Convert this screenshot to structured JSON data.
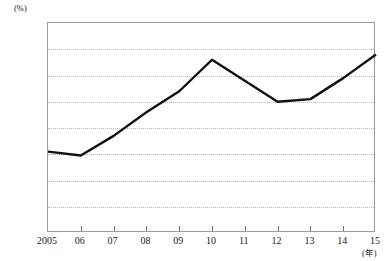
{
  "chart_data": {
    "type": "line",
    "title": "",
    "xlabel": "(年)",
    "ylabel": "(%)",
    "categories": [
      "2005",
      "06",
      "07",
      "08",
      "09",
      "10",
      "11",
      "12",
      "13",
      "14",
      "15"
    ],
    "x": [
      2005,
      2006,
      2007,
      2008,
      2009,
      2010,
      2011,
      2012,
      2013,
      2014,
      2015
    ],
    "values": [
      60.1,
      59.95,
      60.7,
      61.6,
      62.4,
      63.6,
      62.8,
      62.0,
      62.1,
      62.9,
      63.8
    ],
    "series": [
      {
        "name": "",
        "values": [
          60.1,
          59.95,
          60.7,
          61.6,
          62.4,
          63.6,
          62.8,
          62.0,
          62.1,
          62.9,
          63.8
        ]
      }
    ],
    "ylim": [
      57.0,
      65.0
    ],
    "ytick_step": 1.0,
    "ytick_labels": [
      "65.0",
      "64.0",
      "63.0",
      "62.0",
      "61.0",
      "60.0",
      "59.0",
      "58.0",
      "57.0"
    ],
    "ytick_values": [
      65.0,
      64.0,
      63.0,
      62.0,
      61.0,
      60.0,
      59.0,
      58.0,
      57.0
    ],
    "grid": true,
    "grid_axis": "y",
    "legend": false,
    "legend_position": "none",
    "line_color": "#111111",
    "line_width": 2.4,
    "grid_color": "#b9b9b9",
    "frame_color": "#9a9a9a",
    "markers": false
  }
}
